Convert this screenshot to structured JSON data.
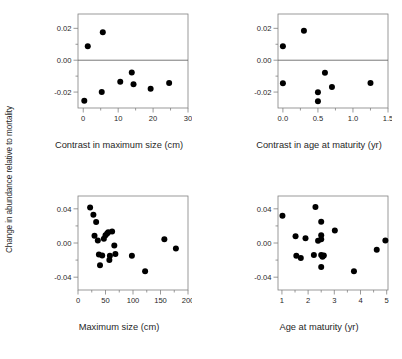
{
  "figure": {
    "shared_ylabel": "Change in abundance relative to mortality",
    "background_color": "#ffffff",
    "marker_color": "#000000",
    "axis_color": "#808080",
    "text_color": "#1f1f1f"
  },
  "chart_data": [
    {
      "type": "scatter",
      "panel": "top-left",
      "title": "",
      "xlabel": "Contrast in maximum size (cm)",
      "ylabel": "Change in abundance relative to mortality",
      "xlim": [
        -1.5,
        30
      ],
      "ylim": [
        -0.03,
        0.029
      ],
      "xticks": [
        0,
        10,
        20,
        30
      ],
      "xtick_labels": [
        "0",
        "10",
        "20",
        "30"
      ],
      "xminorticks": [
        5,
        15,
        25
      ],
      "yticks": [
        0.02,
        0.0,
        -0.02
      ],
      "ytick_labels": [
        "0.02",
        "0.00",
        "-0.02"
      ],
      "yminorticks": [
        0.01,
        -0.01
      ],
      "grid": false,
      "zero_line": true,
      "legend": "none",
      "x": [
        0.3,
        1.3,
        5.6,
        5.3,
        10.6,
        13.9,
        14.4,
        19.3,
        24.6
      ],
      "y": [
        -0.0255,
        0.0088,
        0.0175,
        -0.0199,
        -0.0136,
        -0.0077,
        -0.0151,
        -0.0179,
        -0.0143
      ]
    },
    {
      "type": "scatter",
      "panel": "top-right",
      "title": "",
      "xlabel": "Contrast in age at maturity (yr)",
      "ylabel": "Change in abundance relative to mortality",
      "xlim": [
        -0.07,
        1.5
      ],
      "ylim": [
        -0.03,
        0.029
      ],
      "xticks": [
        0.0,
        0.5,
        1.0,
        1.5
      ],
      "xtick_labels": [
        "0.0",
        "0.5",
        "1.0",
        "1.5"
      ],
      "xminorticks": [
        0.25,
        0.75,
        1.25
      ],
      "yticks": [
        0.02,
        0.0,
        -0.02
      ],
      "ytick_labels": [
        "0.02",
        "0.00",
        "-0.02"
      ],
      "yminorticks": [
        0.01,
        -0.01
      ],
      "grid": false,
      "zero_line": true,
      "legend": "none",
      "x": [
        0.0,
        0.0,
        0.3,
        0.5,
        0.5,
        0.6,
        0.7,
        1.25
      ],
      "y": [
        0.0088,
        -0.0145,
        0.0185,
        -0.0201,
        -0.0257,
        -0.0078,
        -0.0168,
        -0.0143
      ]
    },
    {
      "type": "scatter",
      "panel": "bottom-left",
      "title": "",
      "xlabel": "Maximum size (cm)",
      "ylabel": "Change in abundance relative to mortality",
      "xlim": [
        0,
        200
      ],
      "ylim": [
        -0.055,
        0.055
      ],
      "xticks": [
        0,
        50,
        100,
        150,
        200
      ],
      "xtick_labels": [
        "0",
        "50",
        "100",
        "150",
        "200"
      ],
      "xminorticks": [
        25,
        75,
        125,
        175
      ],
      "yticks": [
        0.04,
        0.0,
        -0.04
      ],
      "ytick_labels": [
        "0.04",
        "0.00",
        "-0.04"
      ],
      "yminorticks": [
        0.02,
        -0.02
      ],
      "grid": false,
      "zero_line": false,
      "legend": "none",
      "x": [
        22,
        28,
        33,
        30,
        36,
        38,
        40,
        44,
        47,
        50,
        53,
        55,
        57,
        58,
        62,
        66,
        68,
        98,
        122,
        157,
        178
      ],
      "y": [
        0.0415,
        0.033,
        0.0245,
        0.0085,
        0.003,
        -0.0135,
        -0.026,
        -0.0145,
        0.005,
        0.009,
        0.011,
        0.0125,
        -0.02,
        -0.0148,
        0.0135,
        -0.003,
        -0.013,
        -0.015,
        -0.033,
        0.0045,
        -0.0065
      ]
    },
    {
      "type": "scatter",
      "panel": "bottom-right",
      "title": "",
      "xlabel": "Age at maturity (yr)",
      "ylabel": "Change in abundance relative to mortality",
      "xlim": [
        0.85,
        5.05
      ],
      "ylim": [
        -0.055,
        0.055
      ],
      "xticks": [
        1,
        2,
        3,
        4,
        5
      ],
      "xtick_labels": [
        "1",
        "2",
        "3",
        "4",
        "5"
      ],
      "xminorticks": [
        1.5,
        2.5,
        3.5,
        4.5
      ],
      "yticks": [
        0.04,
        0.0,
        -0.04
      ],
      "ytick_labels": [
        "0.04",
        "0.00",
        "-0.04"
      ],
      "yminorticks": [
        0.02,
        -0.02
      ],
      "grid": false,
      "zero_line": false,
      "legend": "none",
      "x": [
        1.02,
        1.52,
        1.55,
        1.72,
        1.9,
        2.22,
        2.28,
        2.38,
        2.5,
        2.5,
        2.5,
        2.5,
        2.5,
        2.55,
        2.6,
        3.02,
        3.75,
        4.62,
        4.95
      ],
      "y": [
        0.032,
        0.008,
        -0.015,
        -0.0175,
        0.0055,
        -0.014,
        0.042,
        0.0025,
        0.025,
        0.009,
        0.0045,
        -0.014,
        -0.028,
        -0.016,
        -0.0145,
        0.0145,
        -0.033,
        -0.008,
        0.003
      ]
    }
  ]
}
